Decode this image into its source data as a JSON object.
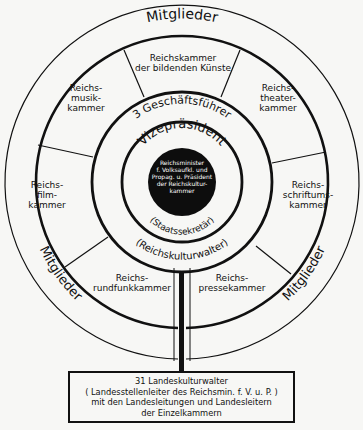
{
  "diagram": {
    "outer_ring_labels": {
      "top": "Mitglieder",
      "bottom_left": "Mitglieder",
      "bottom_right": "Mitglieder"
    },
    "chambers": [
      {
        "id": "bildende-kuenste",
        "label": "Reichskammer\nder bildenden Künste"
      },
      {
        "id": "theater",
        "label": "Reichs-\ntheater-\nkammer"
      },
      {
        "id": "schrifttum",
        "label": "Reichs-\nschriftums-\nkammer"
      },
      {
        "id": "presse",
        "label": "Reichs-\npressekammer"
      },
      {
        "id": "rundfunk",
        "label": "Reichs-\nrundfunkkammer"
      },
      {
        "id": "film",
        "label": "Reichs-\nfilm-\nkammer"
      },
      {
        "id": "musik",
        "label": "Reichs-\nmusik-\nkammer"
      }
    ],
    "rings": {
      "geschaeftsfuehrer": "3 Geschäftsführer",
      "reichskulturwalter": "(Reichskulturwalter)",
      "vizepraesident": "Vizepräsident",
      "staatssekretaer": "(Staatssekretär)"
    },
    "center": {
      "label": "Reichsminister\nf. Volksaufkl. und\nPropag. u. Präsident\nder Reichskultur-\nkammer"
    },
    "bottom_box": {
      "label": "31 Landeskulturwalter\n( Landesstellenleiter des Reichsmin. f. V. u. P. )\nmit den Landesleitungen und Landesleitern\nder Einzelkammern"
    }
  }
}
